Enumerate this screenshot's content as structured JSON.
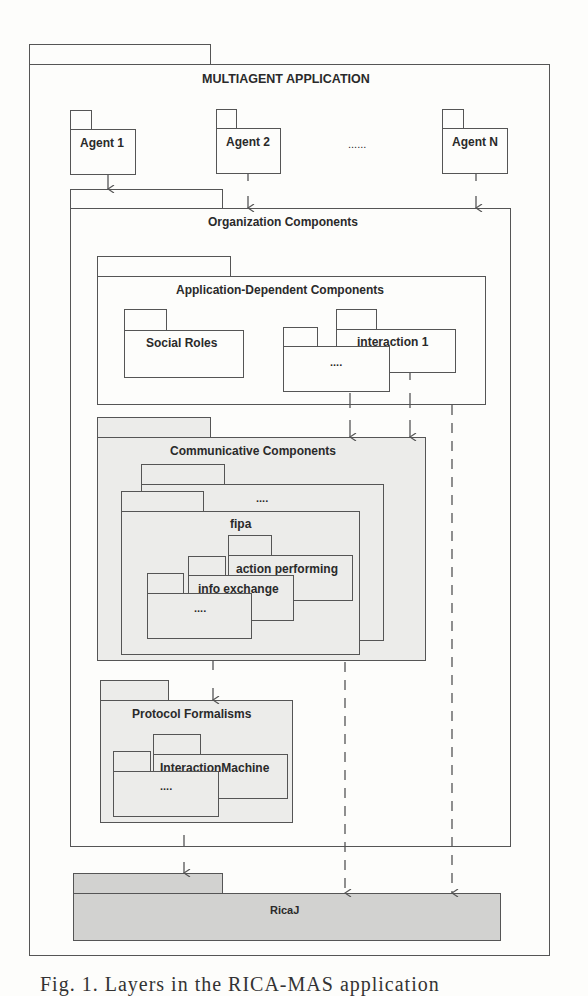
{
  "diagram": {
    "outer": {
      "label": "MULTIAGENT APPLICATION"
    },
    "agents": [
      {
        "label": "Agent 1"
      },
      {
        "label": "Agent 2"
      },
      {
        "label": "Agent N"
      }
    ],
    "agents_ellipsis": "......",
    "organization": {
      "label": "Organization Components"
    },
    "application_dependent": {
      "label": "Application-Dependent Components",
      "children": [
        {
          "label": "Social Roles"
        },
        {
          "label": "interaction 1"
        },
        {
          "label": "...."
        }
      ]
    },
    "communicative": {
      "label": "Communicative Components",
      "children": [
        {
          "label": "...."
        },
        {
          "label": "fipa",
          "children": [
            {
              "label": "action performing"
            },
            {
              "label": "info exchange"
            },
            {
              "label": "...."
            }
          ]
        }
      ]
    },
    "protocol_formalisms": {
      "label": "Protocol Formalisms",
      "children": [
        {
          "label": "InteractionMachine"
        },
        {
          "label": "...."
        }
      ]
    },
    "ricaj": {
      "label": "RicaJ"
    }
  },
  "caption": "Fig. 1. Layers in the RICA-MAS application",
  "colors": {
    "line": "#555555",
    "communicative_fill": "#ececea",
    "ricaj_fill": "#d2d2d0",
    "background": "#fdfdfb"
  }
}
